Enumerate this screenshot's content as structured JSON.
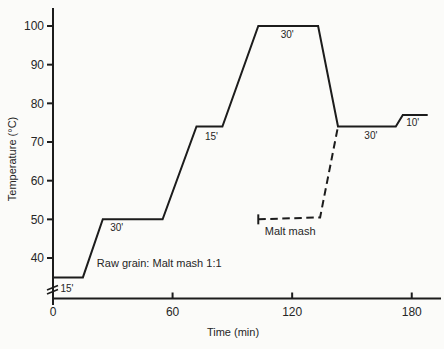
{
  "colors": {
    "line": "#1c1c1c",
    "text": "#262626",
    "background": "#fbfbf9"
  },
  "chart_data": {
    "type": "line",
    "title": "",
    "xlabel": "Time (min)",
    "ylabel": "Temperature (°C)",
    "x_ticks": [
      0,
      60,
      120,
      180
    ],
    "y_ticks": [
      40,
      50,
      60,
      70,
      80,
      90,
      100
    ],
    "xlim": [
      0,
      195
    ],
    "ylim": [
      30,
      104
    ],
    "y_axis_break": true,
    "grid": false,
    "legend_position": "inline-annotations",
    "series": [
      {
        "name": "Raw grain: Malt mash 1:1",
        "style": "solid",
        "start_tick": false,
        "points": [
          [
            0,
            35
          ],
          [
            15,
            35
          ],
          [
            25,
            50
          ],
          [
            55,
            50
          ],
          [
            72,
            74
          ],
          [
            85,
            74
          ],
          [
            103,
            100
          ],
          [
            133,
            100
          ],
          [
            143,
            74
          ],
          [
            172,
            74
          ],
          [
            175.5,
            77
          ],
          [
            188,
            77
          ]
        ]
      },
      {
        "name": "Malt mash",
        "style": "dashed",
        "start_tick": true,
        "points": [
          [
            103,
            50
          ],
          [
            134,
            50.5
          ],
          [
            143,
            74
          ]
        ]
      }
    ],
    "annotations": [
      {
        "text": "15'",
        "t": 7,
        "T": 32.3,
        "anchor": "middle",
        "kind": "duration"
      },
      {
        "text": "30'",
        "t": 32,
        "T": 48.0,
        "anchor": "middle",
        "kind": "duration"
      },
      {
        "text": "15'",
        "t": 79.5,
        "T": 71.6,
        "anchor": "middle",
        "kind": "duration"
      },
      {
        "text": "30'",
        "t": 117.5,
        "T": 97.9,
        "anchor": "middle",
        "kind": "duration"
      },
      {
        "text": "30'",
        "t": 159.5,
        "T": 71.8,
        "anchor": "middle",
        "kind": "duration"
      },
      {
        "text": "10'",
        "t": 180.5,
        "T": 75.2,
        "anchor": "middle",
        "kind": "duration"
      },
      {
        "text": "Raw grain: Malt mash 1:1",
        "t": 22,
        "T": 38.6,
        "anchor": "start",
        "kind": "series-label"
      },
      {
        "text": "Malt mash",
        "t": 119,
        "T": 47.0,
        "anchor": "middle",
        "kind": "series-label"
      }
    ]
  }
}
